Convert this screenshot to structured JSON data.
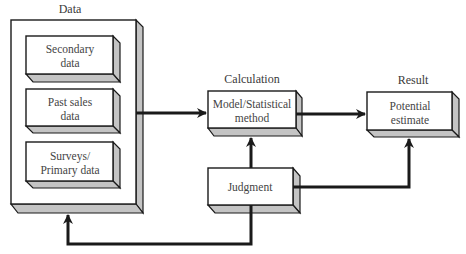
{
  "diagram": {
    "colors": {
      "face": "#ffffff",
      "side": "#c4c4c4",
      "stroke": "#1a1a1a",
      "text": "#3a3a3a"
    },
    "group_labels": {
      "data": "Data",
      "calculation": "Calculation",
      "result": "Result"
    },
    "data_boxes": [
      {
        "line1": "Secondary",
        "line2": "data"
      },
      {
        "line1": "Past sales",
        "line2": "data"
      },
      {
        "line1": "Surveys/",
        "line2": "Primary data"
      }
    ],
    "model_box": {
      "line1": "Model/Statistical",
      "line2": "method"
    },
    "result_box": {
      "line1": "Potential",
      "line2": "estimate"
    },
    "judgment_box": {
      "label": "Judgment"
    },
    "connections": [
      {
        "from": "Data",
        "to": "Model/Statistical method"
      },
      {
        "from": "Model/Statistical method",
        "to": "Potential estimate"
      },
      {
        "from": "Judgment",
        "to": "Model/Statistical method"
      },
      {
        "from": "Judgment",
        "to": "Potential estimate"
      },
      {
        "from": "Judgment",
        "to": "Data"
      }
    ]
  }
}
